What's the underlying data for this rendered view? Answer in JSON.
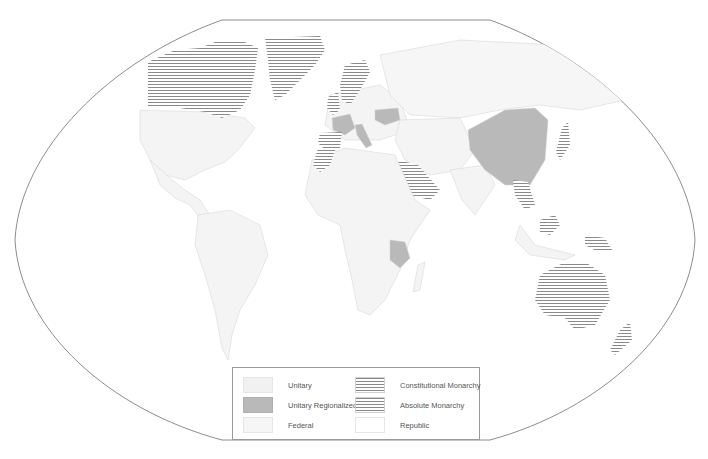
{
  "map": {
    "title": "World map of government systems",
    "projection": "Winkel-like oval world projection",
    "colors": {
      "outline": "#6f6f6f",
      "unitary": "#f1f1f1",
      "unitary_regionalized": "#b9b9b9",
      "federal": "#f6f6f6",
      "republic": "#ffffff",
      "hatch_line": "#8a8a8a",
      "border": "#d0d0d0"
    },
    "highlighted_regions": [
      {
        "name": "Canada",
        "category": "Constitutional Monarchy"
      },
      {
        "name": "Greenland",
        "category": "Constitutional Monarchy"
      },
      {
        "name": "Scandinavia",
        "category": "Constitutional Monarchy"
      },
      {
        "name": "United Kingdom",
        "category": "Constitutional Monarchy"
      },
      {
        "name": "Spain",
        "category": "Constitutional Monarchy"
      },
      {
        "name": "Morocco",
        "category": "Constitutional Monarchy"
      },
      {
        "name": "France",
        "category": "Unitary Regionalized"
      },
      {
        "name": "Italy",
        "category": "Unitary Regionalized"
      },
      {
        "name": "Ukraine",
        "category": "Unitary Regionalized"
      },
      {
        "name": "China",
        "category": "Unitary Regionalized"
      },
      {
        "name": "Tanzania",
        "category": "Unitary Regionalized"
      },
      {
        "name": "Saudi Arabia",
        "category": "Absolute Monarchy"
      },
      {
        "name": "Japan",
        "category": "Constitutional Monarchy"
      },
      {
        "name": "Thailand",
        "category": "Constitutional Monarchy"
      },
      {
        "name": "Cambodia",
        "category": "Constitutional Monarchy"
      },
      {
        "name": "Malaysia",
        "category": "Constitutional Monarchy"
      },
      {
        "name": "Papua New Guinea",
        "category": "Constitutional Monarchy"
      },
      {
        "name": "Australia",
        "category": "Constitutional Monarchy"
      },
      {
        "name": "New Zealand",
        "category": "Constitutional Monarchy"
      }
    ]
  },
  "legend": {
    "items": [
      {
        "label": "Unitary",
        "swatch": "unitary"
      },
      {
        "label": "Unitary Regionalized",
        "swatch": "regional"
      },
      {
        "label": "Federal",
        "swatch": "federal"
      },
      {
        "label": "Constitutional Monarchy",
        "swatch": "hatch"
      },
      {
        "label": "Absolute Monarchy",
        "swatch": "hatch"
      },
      {
        "label": "Republic",
        "swatch": "republic"
      }
    ]
  }
}
